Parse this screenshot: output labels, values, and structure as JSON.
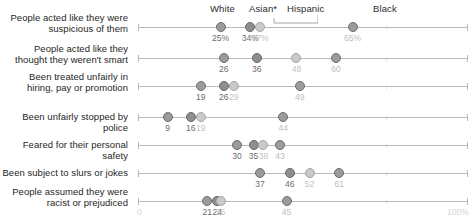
{
  "chart_data": {
    "type": "scatter",
    "title": "",
    "subtitle": "",
    "xlabel": "",
    "ylabel": "",
    "xlim": [
      0,
      100
    ],
    "grid": false,
    "legend_position": "top",
    "axis_ticks": {
      "left": "0",
      "right": "100%"
    },
    "legend": [
      "White",
      "Asian*",
      "Hispanic",
      "Black"
    ],
    "categories": [
      "People acted like they were suspicious of them",
      "People acted like they thought they weren't smart",
      "Been treated unfairly in hiring, pay or promotion",
      "Been unfairly stopped by police",
      "Feared for their personal safety",
      "Been subject to slurs or jokes",
      "People assumed they were racist or prejudiced"
    ],
    "series": [
      {
        "name": "White",
        "values": [
          25,
          26,
          19,
          9,
          30,
          37,
          21
        ]
      },
      {
        "name": "Asian*",
        "values": [
          34,
          36,
          26,
          16,
          35,
          46,
          24
        ]
      },
      {
        "name": "Hispanic",
        "values": [
          37,
          48,
          29,
          19,
          38,
          52,
          25
        ]
      },
      {
        "name": "Black",
        "values": [
          65,
          60,
          49,
          44,
          43,
          61,
          45
        ]
      }
    ],
    "value_labels": [
      [
        "25%",
        "34%",
        "37%",
        "65%"
      ],
      [
        "26",
        "36",
        "48",
        "60"
      ],
      [
        "19",
        "26",
        "29",
        "49"
      ],
      [
        "9",
        "16",
        "19",
        "44"
      ],
      [
        "30",
        "35",
        "38",
        "43"
      ],
      [
        "37",
        "46",
        "52",
        "61"
      ],
      [
        "21",
        "24",
        "25",
        "45"
      ]
    ]
  },
  "rows": [
    {
      "line1": "People acted like they were",
      "line2": "suspicious of them"
    },
    {
      "line1": "People acted like they",
      "line2": "thought they weren't smart"
    },
    {
      "line1": "Been treated unfairly in",
      "line2": "hiring, pay or promotion"
    },
    {
      "line1": "Been unfairly stopped by police",
      "line2": ""
    },
    {
      "line1": "Feared for their personal safety",
      "line2": ""
    },
    {
      "line1": "Been subject to slurs or jokes",
      "line2": ""
    },
    {
      "line1": "People assumed they were",
      "line2": "racist or prejudiced"
    }
  ],
  "legend": {
    "white": "White",
    "asian": "Asian*",
    "hispanic": "Hispanic",
    "black": "Black"
  },
  "axis": {
    "start": "0",
    "end": "100%"
  },
  "colors": {
    "dot_white": "#9b9b9b",
    "dot_asian": "#8f8f8f",
    "dot_hispanic": "#c9c9c9",
    "dot_black": "#9b9b9b",
    "axis": "#b9b9b9",
    "label": "#262626"
  }
}
